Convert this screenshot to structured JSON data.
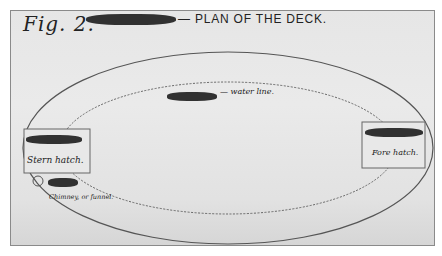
{
  "figure": {
    "label": "Fig. 2.",
    "title": "— PLAN OF THE DECK."
  },
  "annotations": {
    "water_line": "— water line.",
    "stern_hatch": "Stern hatch.",
    "fore_hatch": "Fore hatch.",
    "chimney": "Chimney, or funnel."
  },
  "colors": {
    "paper": "#e6e6e6",
    "ink": "#333333",
    "redaction": "#1e1e1e"
  }
}
